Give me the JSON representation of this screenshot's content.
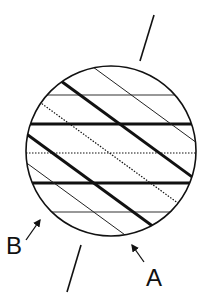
{
  "diagram": {
    "labels": {
      "a": "A",
      "b": "B"
    },
    "colors": {
      "stroke": "#111111",
      "background": "#ffffff"
    },
    "circle": {
      "cx": 111,
      "cy": 151,
      "r": 85
    },
    "axis": {
      "top": {
        "x1": 154,
        "y1": 15,
        "x2": 140,
        "y2": 61
      },
      "bottom": {
        "x1": 81,
        "y1": 245,
        "x2": 67,
        "y2": 292
      }
    },
    "horizontal_lines": [
      {
        "y": 95,
        "style": "thin"
      },
      {
        "y": 124,
        "style": "thick"
      },
      {
        "y": 153,
        "style": "dotted"
      },
      {
        "y": 183,
        "style": "thick"
      },
      {
        "y": 212,
        "style": "thin"
      }
    ],
    "diagonal_lines": [
      {
        "style": "thin",
        "x1": 93,
        "y1": 67,
        "x2": 196,
        "y2": 143
      },
      {
        "style": "thick",
        "x1": 61,
        "y1": 81,
        "x2": 195,
        "y2": 178
      },
      {
        "style": "dotted",
        "x1": 41,
        "y1": 103,
        "x2": 182,
        "y2": 206
      },
      {
        "style": "thick",
        "x1": 28,
        "y1": 130,
        "x2": 158,
        "y2": 225
      },
      {
        "style": "thin",
        "x1": 26,
        "y1": 163,
        "x2": 128,
        "y2": 239
      }
    ],
    "arrows": {
      "a": {
        "x1": 144,
        "y1": 262,
        "x2": 131,
        "y2": 243
      },
      "b": {
        "x1": 26,
        "y1": 240,
        "x2": 41,
        "y2": 218
      }
    }
  }
}
